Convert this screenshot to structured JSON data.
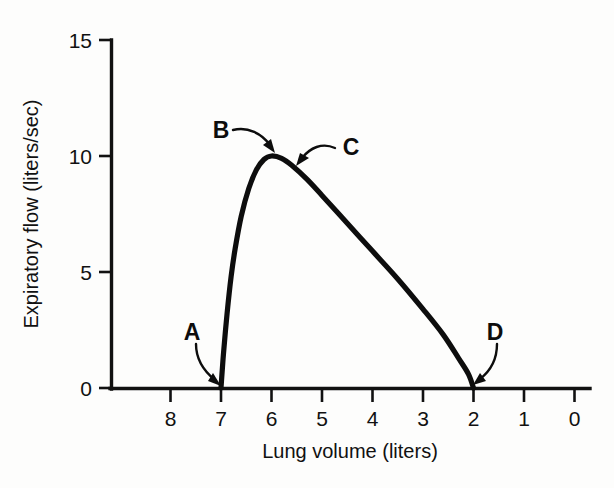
{
  "figure": {
    "background_color": "#fdfdfc",
    "ink_color": "#111111"
  },
  "chart_data": {
    "type": "line",
    "title": "",
    "subtitle": "",
    "xlabel": "Lung volume (liters)",
    "ylabel": "Expiratory flow (liters/sec)",
    "xlim": [
      8.6,
      0
    ],
    "ylim": [
      0,
      15.6
    ],
    "x_axis_inverted": true,
    "grid": false,
    "legend": "none",
    "x_ticks": [
      8,
      7,
      6,
      5,
      4,
      3,
      2,
      1,
      0
    ],
    "x_tick_labels": [
      "8",
      "7",
      "6",
      "5",
      "4",
      "3",
      "2",
      "1",
      "0"
    ],
    "y_ticks": [
      0,
      5,
      10,
      15
    ],
    "y_tick_labels": [
      "0",
      "5",
      "10",
      "15"
    ],
    "series": [
      {
        "name": "Maximal expiratory flow-volume curve",
        "x": [
          7.0,
          6.95,
          6.88,
          6.8,
          6.72,
          6.6,
          6.45,
          6.3,
          6.15,
          6.0,
          5.8,
          5.6,
          5.3,
          5.0,
          4.5,
          4.0,
          3.5,
          3.0,
          2.6,
          2.3,
          2.1,
          2.0
        ],
        "y": [
          0.0,
          1.5,
          3.2,
          4.8,
          6.0,
          7.4,
          8.6,
          9.4,
          9.85,
          10.0,
          9.9,
          9.6,
          9.0,
          8.3,
          7.1,
          5.9,
          4.7,
          3.4,
          2.3,
          1.3,
          0.6,
          0.0
        ]
      }
    ],
    "annotations": [
      {
        "label": "A",
        "description": "start of forced expiration at total lung capacity",
        "point_x": 7.0,
        "point_y": 0.0,
        "label_x": 7.5,
        "label_y": 1.7
      },
      {
        "label": "B",
        "description": "rising limb approaching peak expiratory flow",
        "point_x": 6.2,
        "point_y": 9.9,
        "label_x": 6.85,
        "label_y": 12.1
      },
      {
        "label": "C",
        "description": "effort-independent descending limb",
        "point_x": 5.6,
        "point_y": 9.5,
        "label_x": 4.5,
        "label_y": 11.1
      },
      {
        "label": "D",
        "description": "end of expiration at residual volume",
        "point_x": 2.0,
        "point_y": 0.0,
        "label_x": 1.6,
        "label_y": 2.6
      }
    ]
  }
}
